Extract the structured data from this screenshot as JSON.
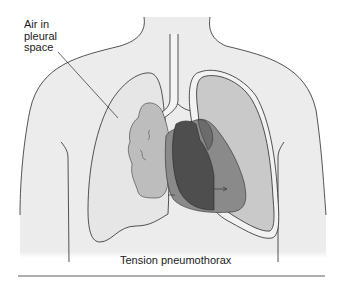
{
  "figure": {
    "caption": "Tension pneumothorax",
    "annotations": [
      {
        "id": "air-in-pleural-space",
        "lines": [
          "Air in",
          "pleural",
          "space"
        ]
      }
    ]
  },
  "colors": {
    "body_fill": "#ececec",
    "outline": "#2a2a2a",
    "collapsed_lung": "#bdbdbd",
    "heart_dark": "#4e4e4e",
    "heart_mid": "#8a8a8a",
    "lung_fill": "#c9c9c9",
    "rule": "#333333"
  }
}
